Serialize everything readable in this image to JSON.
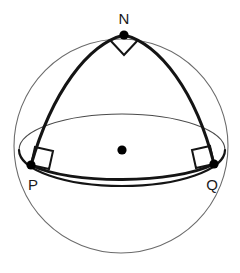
{
  "figure": {
    "name": "spherical-triangle-on-sphere",
    "background_color": "#ffffff"
  },
  "colors": {
    "sphere_outline": "#6b6b6b",
    "equator_back": "#4a4a4a",
    "equator_front": "#141414",
    "arc_stroke": "#141414",
    "dot_fill": "#000000",
    "label_color": "#1a1a1a",
    "right_angle_stroke": "#141414"
  },
  "geometry": {
    "sphere": {
      "cx": 121,
      "cy": 146,
      "r": 107,
      "stroke_width": 1.1
    },
    "equator": {
      "cx": 122,
      "cy": 150,
      "rx": 103,
      "ry": 36,
      "back_stroke_width": 1.1,
      "front_stroke_width": 2.6
    },
    "center_dot": {
      "cx": 122,
      "cy": 150,
      "r": 4.6
    }
  },
  "vertices": [
    {
      "id": "N",
      "label": "N",
      "cx": 124,
      "cy": 35,
      "dot_r": 4.6,
      "label_x": 124,
      "label_y": 24,
      "right_angle": "apex-down"
    },
    {
      "id": "P",
      "label": "P",
      "cx": 31,
      "cy": 165,
      "dot_r": 4.6,
      "label_x": 33,
      "label_y": 190,
      "right_angle": "square-upper-right"
    },
    {
      "id": "Q",
      "label": "Q",
      "cx": 214,
      "cy": 164,
      "dot_r": 4.6,
      "label_x": 212,
      "label_y": 190,
      "right_angle": "square-upper-left"
    }
  ],
  "arcs": [
    {
      "id": "arc-NP",
      "from": "N",
      "to": "P",
      "stroke_width": 3.0,
      "bulge": "outward-left"
    },
    {
      "id": "arc-NQ",
      "from": "N",
      "to": "Q",
      "stroke_width": 3.0,
      "bulge": "outward-right"
    },
    {
      "id": "arc-PQ",
      "from": "P",
      "to": "Q",
      "stroke_width": 2.8,
      "bulge": "downward"
    }
  ],
  "angle_markers": [
    {
      "id": "angle-at-N",
      "vertex": "N",
      "type": "right-angle",
      "symbol": "square"
    },
    {
      "id": "angle-at-P",
      "vertex": "P",
      "type": "right-angle",
      "symbol": "square"
    },
    {
      "id": "angle-at-Q",
      "vertex": "Q",
      "type": "right-angle",
      "symbol": "square"
    }
  ]
}
